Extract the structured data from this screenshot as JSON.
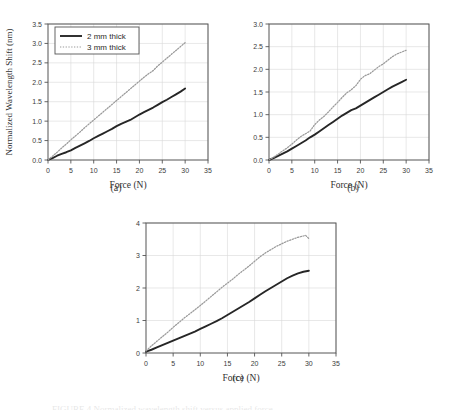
{
  "figure": {
    "background": "#ffffff",
    "series_colors": {
      "solid": "#262626",
      "dotted": "#9a9a9a"
    },
    "grid_color": "#d8d8d8",
    "axis_color": "#555555",
    "bottom_partial_text": "FIGURE 4  Normalized wavelength shift versus applied force"
  },
  "legend": {
    "entries": [
      {
        "label": "2 mm thick",
        "style": "solid"
      },
      {
        "label": "3 mm thick",
        "style": "dotted"
      }
    ]
  },
  "chart_data": [
    {
      "id": "a",
      "type": "line",
      "caption": "(a)",
      "title": "",
      "xlabel": "Force (N)",
      "ylabel": "Normalized Wavelength Shift (nm)",
      "xlim": [
        0,
        35
      ],
      "ylim": [
        0,
        3.5
      ],
      "xticks": [
        0,
        5,
        10,
        15,
        20,
        25,
        30,
        35
      ],
      "yticks": [
        0.0,
        0.5,
        1.0,
        1.5,
        2.0,
        2.5,
        3.0,
        3.5
      ],
      "ytick_labels": [
        "0.0",
        "0.5",
        "1.0",
        "1.5",
        "2.0",
        "2.5",
        "3.0",
        "3.5"
      ],
      "xtick_labels": [
        "0",
        "5",
        "10",
        "15",
        "20",
        "25",
        "30",
        "35"
      ],
      "grid": true,
      "legend": true,
      "legend_position": "upper left",
      "series": [
        {
          "name": "2 mm thick",
          "style": "solid",
          "x": [
            0,
            1,
            2,
            3,
            4,
            5,
            6,
            7,
            8,
            9,
            10,
            11,
            12,
            13,
            14,
            15,
            16,
            17,
            18,
            19,
            20,
            21,
            22,
            23,
            24,
            25,
            26,
            27,
            28,
            29,
            30
          ],
          "values": [
            0.0,
            0.05,
            0.11,
            0.16,
            0.2,
            0.25,
            0.31,
            0.37,
            0.43,
            0.49,
            0.56,
            0.62,
            0.68,
            0.74,
            0.8,
            0.87,
            0.93,
            0.98,
            1.03,
            1.1,
            1.17,
            1.23,
            1.29,
            1.35,
            1.42,
            1.49,
            1.55,
            1.62,
            1.69,
            1.76,
            1.84
          ]
        },
        {
          "name": "3 mm thick",
          "style": "dotted",
          "x": [
            0,
            1,
            2,
            3,
            4,
            5,
            6,
            7,
            8,
            9,
            10,
            11,
            12,
            13,
            14,
            15,
            16,
            17,
            18,
            19,
            20,
            21,
            22,
            23,
            24,
            25,
            26,
            27,
            28,
            29,
            30
          ],
          "values": [
            0.0,
            0.1,
            0.2,
            0.31,
            0.41,
            0.52,
            0.62,
            0.72,
            0.83,
            0.93,
            1.03,
            1.13,
            1.23,
            1.33,
            1.43,
            1.53,
            1.63,
            1.73,
            1.83,
            1.93,
            2.03,
            2.13,
            2.22,
            2.3,
            2.42,
            2.52,
            2.62,
            2.72,
            2.82,
            2.92,
            3.02
          ]
        }
      ]
    },
    {
      "id": "b",
      "type": "line",
      "caption": "(b)",
      "title": "",
      "xlabel": "Force (N)",
      "ylabel": "",
      "xlim": [
        0,
        35
      ],
      "ylim": [
        0,
        3.0
      ],
      "xticks": [
        0,
        5,
        10,
        15,
        20,
        25,
        30,
        35
      ],
      "yticks": [
        0.0,
        0.5,
        1.0,
        1.5,
        2.0,
        2.5,
        3.0
      ],
      "ytick_labels": [
        "0.0",
        "0.5",
        "1.0",
        "1.5",
        "2.0",
        "2.5",
        "3.0"
      ],
      "xtick_labels": [
        "0",
        "5",
        "10",
        "15",
        "20",
        "25",
        "30",
        "35"
      ],
      "grid": true,
      "legend": false,
      "series": [
        {
          "name": "2 mm thick",
          "style": "solid",
          "x": [
            0,
            1,
            2,
            3,
            4,
            5,
            6,
            7,
            8,
            9,
            10,
            11,
            12,
            13,
            14,
            15,
            16,
            17,
            18,
            19,
            20,
            21,
            22,
            23,
            24,
            25,
            26,
            27,
            28,
            29,
            30
          ],
          "values": [
            0.0,
            0.04,
            0.09,
            0.14,
            0.19,
            0.25,
            0.31,
            0.37,
            0.43,
            0.5,
            0.56,
            0.63,
            0.7,
            0.77,
            0.84,
            0.91,
            0.98,
            1.04,
            1.1,
            1.14,
            1.2,
            1.26,
            1.32,
            1.38,
            1.44,
            1.5,
            1.56,
            1.62,
            1.67,
            1.72,
            1.77
          ]
        },
        {
          "name": "3 mm thick",
          "style": "dotted",
          "x": [
            0,
            1,
            2,
            3,
            4,
            5,
            6,
            7,
            8,
            9,
            10,
            11,
            12,
            13,
            14,
            15,
            16,
            17,
            18,
            19,
            20,
            21,
            22,
            23,
            24,
            25,
            26,
            27,
            28,
            29,
            30
          ],
          "values": [
            0.0,
            0.06,
            0.13,
            0.2,
            0.27,
            0.35,
            0.44,
            0.52,
            0.58,
            0.64,
            0.78,
            0.88,
            0.96,
            1.06,
            1.17,
            1.27,
            1.38,
            1.48,
            1.55,
            1.64,
            1.78,
            1.86,
            1.9,
            1.98,
            2.06,
            2.12,
            2.2,
            2.28,
            2.34,
            2.38,
            2.42
          ]
        }
      ]
    },
    {
      "id": "c",
      "type": "line",
      "caption": "(c)",
      "title": "",
      "xlabel": "Force (N)",
      "ylabel": "",
      "xlim": [
        0,
        35
      ],
      "ylim": [
        0,
        4
      ],
      "xticks": [
        0,
        5,
        10,
        15,
        20,
        25,
        30,
        35
      ],
      "yticks": [
        0,
        1,
        2,
        3,
        4
      ],
      "ytick_labels": [
        "0",
        "1",
        "2",
        "3",
        "4"
      ],
      "xtick_labels": [
        "0",
        "5",
        "10",
        "15",
        "20",
        "25",
        "30",
        "35"
      ],
      "grid": true,
      "legend": false,
      "series": [
        {
          "name": "2 mm thick",
          "style": "solid",
          "x": [
            0,
            1,
            2,
            3,
            4,
            5,
            6,
            7,
            8,
            9,
            10,
            11,
            12,
            13,
            14,
            15,
            16,
            17,
            18,
            19,
            20,
            21,
            22,
            23,
            24,
            25,
            26,
            27,
            28,
            29,
            30
          ],
          "values": [
            0.04,
            0.1,
            0.17,
            0.24,
            0.31,
            0.38,
            0.45,
            0.52,
            0.59,
            0.66,
            0.74,
            0.82,
            0.9,
            0.98,
            1.07,
            1.17,
            1.27,
            1.37,
            1.47,
            1.57,
            1.68,
            1.79,
            1.9,
            2.0,
            2.1,
            2.2,
            2.3,
            2.38,
            2.45,
            2.5,
            2.53
          ]
        },
        {
          "name": "3 mm thick",
          "style": "dotted",
          "x": [
            0,
            1,
            2,
            3,
            4,
            5,
            6,
            7,
            8,
            9,
            10,
            11,
            12,
            13,
            14,
            15,
            16,
            17,
            18,
            19,
            20,
            21,
            22,
            23,
            24,
            25,
            26,
            27,
            28,
            29,
            29.4,
            30
          ],
          "values": [
            0.06,
            0.22,
            0.36,
            0.5,
            0.64,
            0.79,
            0.93,
            1.07,
            1.2,
            1.33,
            1.46,
            1.6,
            1.74,
            1.88,
            2.02,
            2.15,
            2.28,
            2.42,
            2.55,
            2.68,
            2.82,
            2.96,
            3.08,
            3.18,
            3.28,
            3.36,
            3.44,
            3.5,
            3.56,
            3.6,
            3.62,
            3.52
          ]
        }
      ]
    }
  ]
}
